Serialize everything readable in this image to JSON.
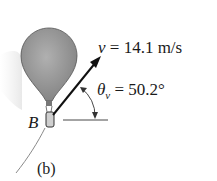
{
  "figure": {
    "velocity_label": {
      "symbol": "v",
      "value": "= 14.1 m/s"
    },
    "angle_label": {
      "symbol": "θ",
      "subscript": "v",
      "value": "= 50.2°"
    },
    "point_label": "B",
    "caption": "(b)"
  },
  "colors": {
    "balloon": "#9a9a9a",
    "ink": "#1a1a1a",
    "path": "#888888"
  }
}
